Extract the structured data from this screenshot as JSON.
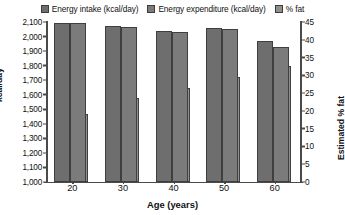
{
  "chart_data": {
    "type": "bar",
    "title": "",
    "xlabel": "Age (years)",
    "ylabel": "kcal/day",
    "ylabel_right": "Estimated % fat",
    "categories": [
      "20",
      "30",
      "40",
      "50",
      "60"
    ],
    "ylim": [
      1000,
      2100
    ],
    "ylim_right": [
      0,
      45
    ],
    "yticks": [
      "2,100",
      "2,000",
      "1,900",
      "1,800",
      "1,700",
      "1,600",
      "1,500",
      "1,400",
      "1,300",
      "1,200",
      "1,100",
      "1,000"
    ],
    "yticks_right": [
      "45",
      "40",
      "35",
      "30",
      "25",
      "20",
      "15",
      "10",
      "5",
      "0"
    ],
    "grid": false,
    "legend_position": "top",
    "series": [
      {
        "name": "Energy intake (kcal/day)",
        "axis": "left",
        "color": "#6e6e6e",
        "values": [
          2090,
          2070,
          2040,
          2060,
          1970
        ]
      },
      {
        "name": "Energy expenditure (kcal/day)",
        "axis": "left",
        "color": "#7b7b7b",
        "values": [
          2090,
          2065,
          2030,
          2050,
          1930
        ]
      },
      {
        "name": "% fat",
        "axis": "right",
        "color": "#8f8f8f",
        "values": [
          19.0,
          23.5,
          26.5,
          29.5,
          32.5
        ]
      }
    ]
  },
  "legend": {
    "items": [
      {
        "label": "Energy intake (kcal/day)",
        "color": "#6e6e6e"
      },
      {
        "label": "Energy expenditure (kcal/day)",
        "color": "#7b7b7b"
      },
      {
        "label": "% fat",
        "color": "#8f8f8f"
      }
    ]
  }
}
